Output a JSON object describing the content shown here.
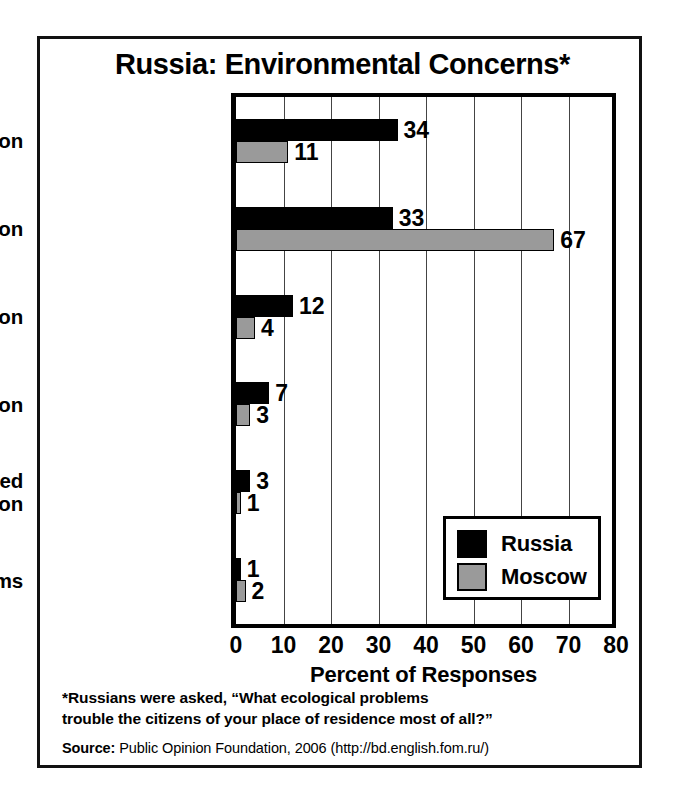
{
  "chart_data": {
    "type": "bar",
    "orientation": "horizontal",
    "title": "Russia: Environmental Concerns*",
    "xlabel": "Percent of Responses",
    "ylabel": "",
    "xlim": [
      0,
      80
    ],
    "xticks": [
      0,
      10,
      20,
      30,
      40,
      50,
      60,
      70,
      80
    ],
    "grid": true,
    "grid_axis": "x",
    "legend_position": "inside-lower-right",
    "categories": [
      "Water pollution",
      "Air pollution",
      "High radiation",
      "Deforestation",
      "Diseases caused by pollution",
      "No problems"
    ],
    "category_label_lines": [
      [
        "Water pollution"
      ],
      [
        "Air pollution"
      ],
      [
        "High radiation"
      ],
      [
        "Deforestation"
      ],
      [
        "Diseases caused",
        "by pollution"
      ],
      [
        "No problems"
      ]
    ],
    "series": [
      {
        "name": "Russia",
        "color": "#000000",
        "values": [
          34,
          33,
          12,
          7,
          3,
          1
        ]
      },
      {
        "name": "Moscow",
        "color": "#9a9a9a",
        "values": [
          11,
          67,
          4,
          3,
          1,
          2
        ]
      }
    ]
  },
  "footnote": {
    "line1": "*Russians were asked, “What ecological problems",
    "line2": "trouble the citizens of your place of residence most of all?”"
  },
  "source": {
    "key": "Source:",
    "text": " Public Opinion Foundation, 2006 (http://bd.english.fom.ru/)"
  },
  "colors": {
    "russia": "#000000",
    "moscow": "#9a9a9a",
    "frame": "#111111",
    "background": "#ffffff"
  }
}
